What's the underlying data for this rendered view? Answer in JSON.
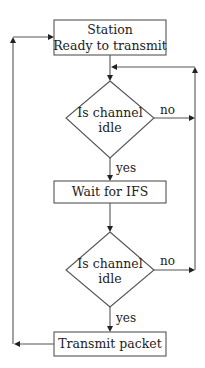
{
  "diagram": {
    "type": "flowchart",
    "nodes": {
      "start": {
        "line1": "Station",
        "line2": "Ready to transmit"
      },
      "check1": {
        "line1": "Is channel",
        "line2": "idle"
      },
      "wait": {
        "label": "Wait for IFS"
      },
      "check2": {
        "line1": "Is channel",
        "line2": "idle"
      },
      "transmit": {
        "label": "Transmit packet"
      }
    },
    "edges": {
      "check1_yes": "yes",
      "check1_no": "no",
      "check2_yes": "yes",
      "check2_no": "no"
    }
  }
}
